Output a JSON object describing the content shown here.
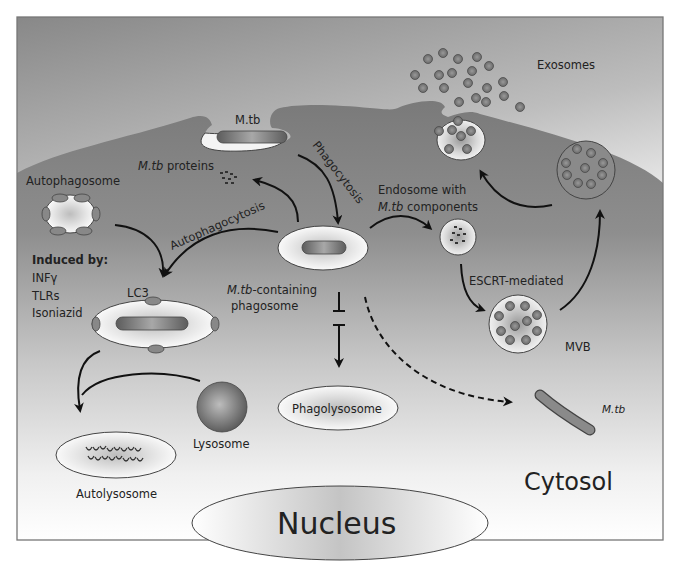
{
  "labels": {
    "mtb_top": "M.tb",
    "phagocytosis": "Phagocytosis",
    "mtb_proteins_italic": "M.tb",
    "mtb_proteins_rest": " proteins",
    "autophagosome": "Autophagosome",
    "autophagocytosis": "Autophagocytosis",
    "induced_by": "Induced by:",
    "inducers": [
      "INFγ",
      "TLRs",
      "Isoniazid"
    ],
    "lc3": "LC3",
    "phagosome_line1_italic": "M.tb",
    "phagosome_line1_rest": "-containing",
    "phagosome_line2": "phagosome",
    "endosome_line1": "Endosome with",
    "endosome_line2_italic": "M.tb",
    "endosome_line2_rest": " components",
    "escrt": "ESCRT-mediated",
    "mvb": "MVB",
    "exosomes": "Exosomes",
    "phagolysosome": "Phagolysosome",
    "lysosome": "Lysosome",
    "autolysosome": "Autolysosome",
    "mtb_cytosol": "M.tb",
    "cytosol": "Cytosol",
    "nucleus": "Nucleus"
  },
  "colors": {
    "background_top": "#8a8a8a",
    "background_bottom": "#ffffff",
    "cell_body": "#7d7d7d",
    "vesicle_light": "#f2f2f2",
    "bacterium": "#6e6e6e",
    "arrow": "#111111",
    "border": "#777777"
  }
}
